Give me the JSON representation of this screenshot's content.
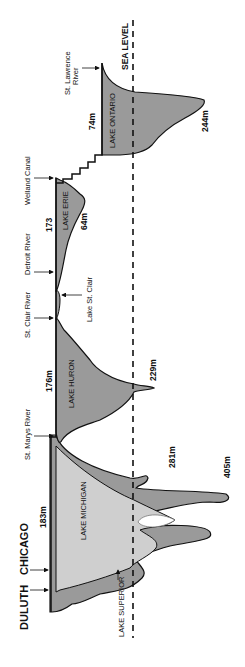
{
  "diagram": {
    "orientation": "rotated-90-ccw",
    "sea_level_label": "SEA LEVEL",
    "colors": {
      "lake_fill_dark": "#9a9a9a",
      "lake_fill_light": "#cfcfcf",
      "outline": "#111111",
      "background": "#ffffff"
    },
    "lakes": [
      {
        "name": "LAKE ONTARIO",
        "surface": "74m",
        "depth": "244m"
      },
      {
        "name": "LAKE ERIE",
        "surface": "173",
        "depth": "64m"
      },
      {
        "name": "LAKE HURON",
        "surface": "176m",
        "depth": "229m"
      },
      {
        "name": "LAKE MICHIGAN",
        "surface": "183m",
        "depth": "281m"
      },
      {
        "name": "LAKE SUPERIOR",
        "depth": "405m"
      }
    ],
    "connectors": [
      {
        "label_line1": "St. Lawrence",
        "label_line2": "River"
      },
      {
        "label": "Welland Canal"
      },
      {
        "label": "Detroit River"
      },
      {
        "label": "Lake St. Clair"
      },
      {
        "label": "St. Clair River"
      },
      {
        "label": "St. Marys River"
      }
    ],
    "cities": [
      {
        "label": "CHICAGO"
      },
      {
        "label": "DULUTH"
      }
    ]
  }
}
